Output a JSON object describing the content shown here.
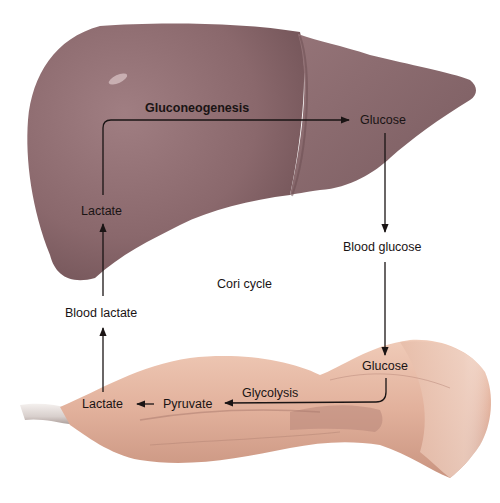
{
  "diagram": {
    "title": "Cori cycle",
    "organs": {
      "liver": {
        "name": "Liver",
        "color": "#8c6c70"
      },
      "muscle": {
        "name": "Muscle",
        "color": "#e3b5a0"
      }
    },
    "labels": {
      "gluconeogenesis": "Gluconeogenesis",
      "liver_glucose": "Glucose",
      "liver_lactate": "Lactate",
      "blood_glucose": "Blood glucose",
      "blood_lactate": "Blood lactate",
      "cori_cycle": "Cori cycle",
      "muscle_glucose": "Glucose",
      "glycolysis": "Glycolysis",
      "pyruvate": "Pyruvate",
      "muscle_lactate": "Lactate"
    },
    "flow": [
      {
        "from": "Lactate (liver)",
        "to": "Glucose (liver)",
        "process": "Gluconeogenesis"
      },
      {
        "from": "Glucose (liver)",
        "to": "Blood glucose"
      },
      {
        "from": "Blood glucose",
        "to": "Glucose (muscle)"
      },
      {
        "from": "Glucose (muscle)",
        "to": "Pyruvate",
        "process": "Glycolysis"
      },
      {
        "from": "Pyruvate",
        "to": "Lactate (muscle)"
      },
      {
        "from": "Lactate (muscle)",
        "to": "Blood lactate"
      },
      {
        "from": "Blood lactate",
        "to": "Lactate (liver)"
      }
    ]
  }
}
